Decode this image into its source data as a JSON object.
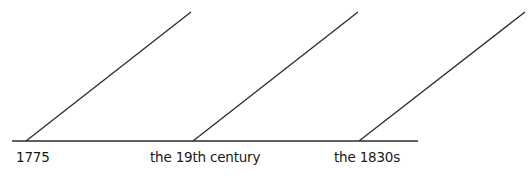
{
  "diagram": {
    "type": "timeline",
    "line_color": "#2a2a2a",
    "labels": [
      "1775",
      "the 19th century",
      "the 1830s"
    ]
  }
}
